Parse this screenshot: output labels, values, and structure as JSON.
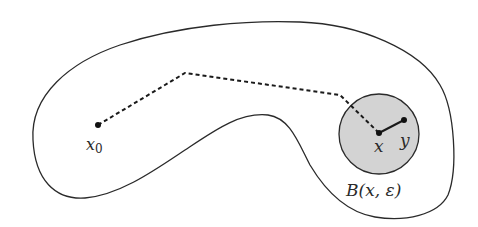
{
  "figure": {
    "colors": {
      "outline": "#2a2a2a",
      "ball_fill": "#d3d3d3",
      "path": "#1a1a1a",
      "background": "#ffffff"
    },
    "region": {
      "name": "open-set-region"
    },
    "points": {
      "x0": {
        "label_main": "x",
        "label_sub": "0",
        "cx": 98,
        "cy": 125
      },
      "x": {
        "label": "x",
        "cx": 379,
        "cy": 133
      },
      "y": {
        "label": "y",
        "cx": 404,
        "cy": 120
      }
    },
    "ball": {
      "label": "B(x, ε)",
      "cx": 379,
      "cy": 134,
      "r": 40
    },
    "dashed_path": {
      "style": "dashed",
      "vertices": [
        [
          98,
          125
        ],
        [
          185,
          73
        ],
        [
          340,
          95
        ],
        [
          379,
          133
        ]
      ]
    },
    "segment_xy": {
      "style": "solid",
      "from": "x",
      "to": "y"
    }
  }
}
